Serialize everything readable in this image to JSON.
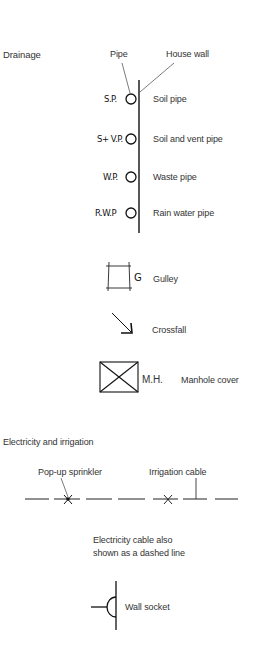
{
  "drainage": {
    "section_title": "Drainage",
    "callouts": {
      "pipe": "Pipe",
      "house_wall": "House wall"
    },
    "pipes": [
      {
        "abbr": "S.P.",
        "label": "Soil pipe"
      },
      {
        "abbr": "S+ V.P.",
        "label": "Soil and vent pipe"
      },
      {
        "abbr": "W.P.",
        "label": "Waste pipe"
      },
      {
        "abbr": "R.W.P",
        "label": "Rain water pipe"
      }
    ],
    "gulley": {
      "abbr": "G",
      "label": "Gulley"
    },
    "crossfall": {
      "label": "Crossfall"
    },
    "manhole": {
      "abbr": "M.H.",
      "label": "Manhole cover"
    }
  },
  "electricity": {
    "section_title": "Electricity and irrigation",
    "callouts": {
      "sprinkler": "Pop-up sprinkler",
      "irrigation_cable": "Irrigation cable"
    },
    "note_line1": "Electricity cable also",
    "note_line2": "shown as a dashed line",
    "wall_socket": {
      "label": "Wall socket"
    }
  },
  "colors": {
    "ink": "#111111",
    "text": "#333333",
    "background": "#ffffff"
  }
}
